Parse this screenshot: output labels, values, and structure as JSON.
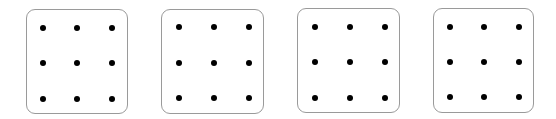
{
  "grid": {
    "rows": 3,
    "cols": 3
  },
  "colors": {
    "background": "#ffffff",
    "border": "#9a9a9a",
    "dot": "#000000"
  },
  "panels": [
    {
      "x": 26,
      "y": 9,
      "w": 102,
      "h": 105,
      "dot_x": [
        16,
        50,
        85
      ],
      "dot_y": [
        18,
        53,
        89
      ]
    },
    {
      "x": 161,
      "y": 9,
      "w": 103,
      "h": 105,
      "dot_x": [
        17,
        52,
        87
      ],
      "dot_y": [
        17,
        53,
        88
      ]
    },
    {
      "x": 297,
      "y": 8,
      "w": 103,
      "h": 105,
      "dot_x": [
        17,
        52,
        87
      ],
      "dot_y": [
        18,
        53,
        89
      ]
    },
    {
      "x": 433,
      "y": 8,
      "w": 101,
      "h": 105,
      "dot_x": [
        16,
        50,
        85
      ],
      "dot_y": [
        18,
        53,
        88
      ]
    }
  ]
}
